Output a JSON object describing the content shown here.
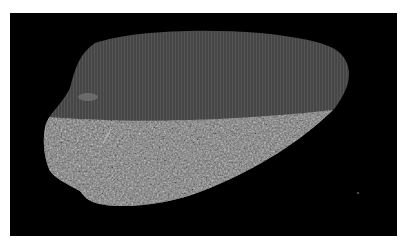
{
  "image": {
    "description": "Grayscale micrograph of an irregular textured fragment on a black background",
    "colors": {
      "page_background": "#ffffff",
      "panel_background": "#000000",
      "upper_region": "#4a4a4a",
      "lower_region": "#7a7a7a"
    }
  }
}
